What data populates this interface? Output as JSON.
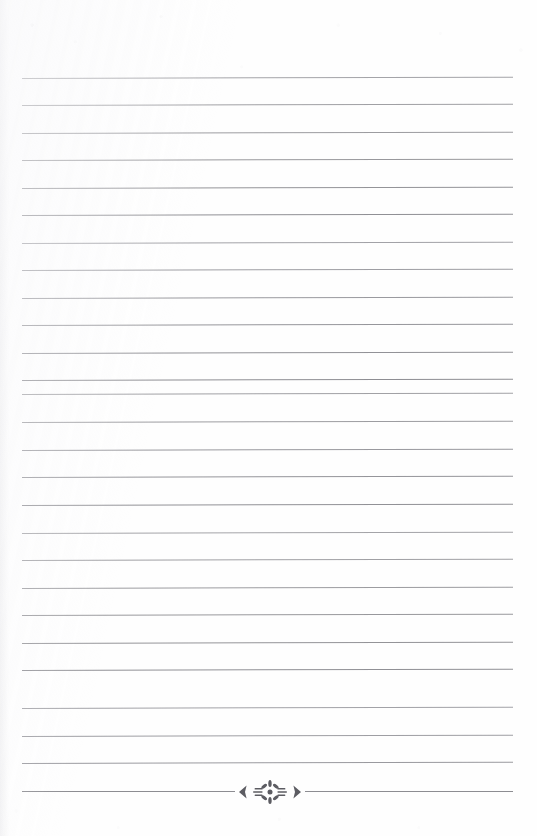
{
  "page": {
    "kind": "scanned-ruled-notebook-page",
    "width_px": 537,
    "height_px": 836,
    "background_color": "#fefefe",
    "content_text": "",
    "note": "blank lined writing page — no written text present"
  },
  "rules": {
    "line_color": "#8d8d92",
    "line_thickness_px": 1,
    "left_x_px": 22,
    "right_x_px": 513,
    "first_line_y_px": 78,
    "line_spacing_px": 27.4,
    "line_count": 27,
    "skew_deg": -0.16,
    "y_positions": [
      78,
      105,
      133,
      160,
      188,
      215,
      243,
      270,
      298,
      325,
      353,
      380,
      394,
      422,
      450,
      477,
      505,
      533,
      560,
      588,
      615,
      643,
      670,
      708,
      736,
      763,
      791
    ]
  },
  "ornament": {
    "name": "floral-burst-divider",
    "center_x_px": 270,
    "center_y_px": 791,
    "width_px": 76,
    "color": "#5c5c62",
    "left_glyph": "❮",
    "right_glyph": "❯",
    "center_glyph": "✻",
    "description": "radiating petal starburst flanked by left and right chevrons, set inline in the final ruled line",
    "gap_left_x_px": 235,
    "gap_right_x_px": 305
  },
  "margins": {
    "top_px": 78,
    "bottom_px": 35,
    "left_px": 22,
    "right_px": 24
  }
}
